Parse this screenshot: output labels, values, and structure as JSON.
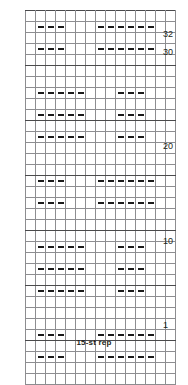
{
  "caption": {
    "repeat_label": "15-st rep"
  },
  "chart_data": {
    "type": "heatmap",
    "title": "",
    "xlabel": "",
    "ylabel": "",
    "columns": 15,
    "rows": 32,
    "row_numbering": "bottom-to-top",
    "legend_position": "none",
    "grid": true,
    "colors": {
      "dark_gray": "#6f6f72",
      "light_gray": "#bdbdc0",
      "white": "#ffffff",
      "grid_line": "#8d8d90",
      "grid_border": "#58585a",
      "symbol": "#1a1a1a",
      "text": "#231f20"
    },
    "symbols": {
      "dash": "purl stitch",
      "blank": "knit stitch"
    },
    "row_tick_labels": [
      {
        "row": 1,
        "label": "1"
      },
      {
        "row": 10,
        "label": "10"
      },
      {
        "row": 20,
        "label": "20"
      },
      {
        "row": 30,
        "label": "30"
      },
      {
        "row": 32,
        "label": "32"
      }
    ],
    "cell_colors": [
      [
        "w",
        "w",
        "w",
        "w",
        "w",
        "w",
        "w",
        "w",
        "w",
        "w",
        "w",
        "w",
        "w",
        "w",
        "w"
      ],
      [
        "w",
        "d",
        "d",
        "d",
        "w",
        "w",
        "w",
        "d",
        "d",
        "d",
        "d",
        "d",
        "d",
        "w",
        "w"
      ],
      [
        "w",
        "d",
        "d",
        "d",
        "w",
        "w",
        "w",
        "d",
        "d",
        "d",
        "d",
        "d",
        "d",
        "w",
        "w"
      ],
      [
        "w",
        "d",
        "d",
        "d",
        "w",
        "w",
        "w",
        "d",
        "d",
        "d",
        "d",
        "d",
        "d",
        "w",
        "w"
      ],
      [
        "w",
        "d",
        "d",
        "d",
        "w",
        "w",
        "w",
        "d",
        "d",
        "d",
        "d",
        "d",
        "d",
        "w",
        "w"
      ],
      [
        "w",
        "w",
        "w",
        "w",
        "w",
        "w",
        "w",
        "w",
        "w",
        "w",
        "w",
        "w",
        "w",
        "w",
        "w"
      ],
      [
        "w",
        "w",
        "w",
        "w",
        "w",
        "w",
        "w",
        "w",
        "w",
        "w",
        "w",
        "w",
        "w",
        "w",
        "w"
      ],
      [
        "w",
        "l",
        "l",
        "l",
        "l",
        "l",
        "w",
        "w",
        "w",
        "l",
        "l",
        "l",
        "w",
        "w",
        "w"
      ],
      [
        "w",
        "l",
        "l",
        "l",
        "l",
        "l",
        "w",
        "w",
        "w",
        "l",
        "l",
        "l",
        "w",
        "w",
        "w"
      ],
      [
        "w",
        "d",
        "d",
        "d",
        "d",
        "d",
        "w",
        "w",
        "w",
        "d",
        "d",
        "d",
        "w",
        "w",
        "w"
      ],
      [
        "w",
        "d",
        "d",
        "d",
        "d",
        "d",
        "w",
        "w",
        "w",
        "d",
        "d",
        "d",
        "w",
        "w",
        "w"
      ],
      [
        "w",
        "l",
        "l",
        "l",
        "l",
        "l",
        "w",
        "w",
        "w",
        "l",
        "l",
        "l",
        "w",
        "w",
        "w"
      ],
      [
        "w",
        "w",
        "w",
        "w",
        "w",
        "w",
        "w",
        "w",
        "w",
        "w",
        "w",
        "w",
        "w",
        "w",
        "w"
      ],
      [
        "w",
        "w",
        "w",
        "w",
        "w",
        "w",
        "w",
        "w",
        "w",
        "w",
        "w",
        "w",
        "w",
        "w",
        "w"
      ],
      [
        "w",
        "w",
        "w",
        "w",
        "w",
        "w",
        "w",
        "w",
        "w",
        "w",
        "w",
        "w",
        "w",
        "w",
        "w"
      ],
      [
        "w",
        "d",
        "d",
        "d",
        "w",
        "w",
        "w",
        "d",
        "d",
        "d",
        "d",
        "d",
        "d",
        "w",
        "w"
      ],
      [
        "w",
        "d",
        "d",
        "d",
        "w",
        "w",
        "w",
        "d",
        "d",
        "d",
        "d",
        "d",
        "d",
        "w",
        "w"
      ],
      [
        "w",
        "d",
        "d",
        "d",
        "w",
        "w",
        "w",
        "d",
        "d",
        "d",
        "d",
        "d",
        "d",
        "w",
        "w"
      ],
      [
        "w",
        "d",
        "d",
        "d",
        "w",
        "w",
        "w",
        "d",
        "d",
        "d",
        "d",
        "d",
        "d",
        "w",
        "w"
      ],
      [
        "w",
        "w",
        "w",
        "w",
        "w",
        "w",
        "w",
        "w",
        "w",
        "w",
        "w",
        "w",
        "w",
        "w",
        "w"
      ],
      [
        "w",
        "w",
        "w",
        "w",
        "w",
        "w",
        "w",
        "w",
        "w",
        "w",
        "w",
        "w",
        "w",
        "w",
        "w"
      ],
      [
        "w",
        "l",
        "l",
        "l",
        "l",
        "l",
        "w",
        "w",
        "w",
        "l",
        "l",
        "l",
        "w",
        "w",
        "w"
      ],
      [
        "w",
        "l",
        "l",
        "l",
        "l",
        "l",
        "w",
        "w",
        "w",
        "l",
        "l",
        "l",
        "w",
        "w",
        "w"
      ],
      [
        "w",
        "d",
        "d",
        "d",
        "d",
        "d",
        "w",
        "w",
        "w",
        "d",
        "d",
        "d",
        "w",
        "w",
        "w"
      ],
      [
        "w",
        "d",
        "d",
        "d",
        "d",
        "d",
        "w",
        "w",
        "w",
        "d",
        "d",
        "d",
        "w",
        "w",
        "w"
      ],
      [
        "w",
        "l",
        "l",
        "l",
        "l",
        "l",
        "w",
        "w",
        "w",
        "l",
        "l",
        "l",
        "w",
        "w",
        "w"
      ],
      [
        "w",
        "w",
        "w",
        "w",
        "w",
        "w",
        "w",
        "w",
        "w",
        "w",
        "w",
        "w",
        "w",
        "w",
        "w"
      ],
      [
        "w",
        "w",
        "w",
        "w",
        "w",
        "w",
        "w",
        "w",
        "w",
        "w",
        "w",
        "w",
        "w",
        "w",
        "w"
      ],
      [
        "w",
        "w",
        "w",
        "w",
        "w",
        "w",
        "w",
        "w",
        "w",
        "w",
        "w",
        "w",
        "w",
        "w",
        "w"
      ],
      [
        "w",
        "d",
        "d",
        "d",
        "w",
        "w",
        "w",
        "d",
        "d",
        "d",
        "d",
        "d",
        "d",
        "w",
        "w"
      ],
      [
        "w",
        "d",
        "d",
        "d",
        "w",
        "w",
        "w",
        "d",
        "d",
        "d",
        "d",
        "d",
        "d",
        "w",
        "w"
      ],
      [
        "w",
        "d",
        "d",
        "d",
        "w",
        "w",
        "w",
        "d",
        "d",
        "d",
        "d",
        "d",
        "d",
        "w",
        "w"
      ],
      [
        "w",
        "d",
        "d",
        "d",
        "w",
        "w",
        "w",
        "d",
        "d",
        "d",
        "d",
        "d",
        "d",
        "w",
        "w"
      ],
      [
        "w",
        "w",
        "w",
        "w",
        "w",
        "w",
        "w",
        "w",
        "w",
        "w",
        "w",
        "w",
        "w",
        "w",
        "w"
      ]
    ],
    "cell_symbols": [
      [
        "",
        "",
        "",
        "",
        "",
        "",
        "",
        "",
        "",
        "",
        "",
        "",
        "",
        "",
        ""
      ],
      [
        "",
        "-",
        "-",
        "-",
        "",
        "",
        "",
        "-",
        "-",
        "-",
        "-",
        "-",
        "-",
        "",
        ""
      ],
      [
        "",
        "",
        "",
        "",
        "",
        "",
        "",
        "",
        "",
        "",
        "",
        "",
        "",
        "",
        ""
      ],
      [
        "",
        "-",
        "-",
        "-",
        "",
        "",
        "",
        "-",
        "-",
        "-",
        "-",
        "-",
        "-",
        "",
        ""
      ],
      [
        "",
        "",
        "",
        "",
        "",
        "",
        "",
        "",
        "",
        "",
        "",
        "",
        "",
        "",
        ""
      ],
      [
        "",
        "",
        "",
        "",
        "",
        "",
        "",
        "",
        "",
        "",
        "",
        "",
        "",
        "",
        ""
      ],
      [
        "",
        "",
        "",
        "",
        "",
        "",
        "",
        "",
        "",
        "",
        "",
        "",
        "",
        "",
        ""
      ],
      [
        "",
        "-",
        "-",
        "-",
        "-",
        "-",
        "",
        "",
        "",
        "-",
        "-",
        "-",
        "",
        "",
        ""
      ],
      [
        "",
        "",
        "",
        "",
        "",
        "",
        "",
        "",
        "",
        "",
        "",
        "",
        "",
        "",
        ""
      ],
      [
        "",
        "-",
        "-",
        "-",
        "-",
        "-",
        "",
        "",
        "",
        "-",
        "-",
        "-",
        "",
        "",
        ""
      ],
      [
        "",
        "",
        "",
        "",
        "",
        "",
        "",
        "",
        "",
        "",
        "",
        "",
        "",
        "",
        ""
      ],
      [
        "",
        "-",
        "-",
        "-",
        "-",
        "-",
        "",
        "",
        "",
        "-",
        "-",
        "-",
        "",
        "",
        ""
      ],
      [
        "",
        "",
        "",
        "",
        "",
        "",
        "",
        "",
        "",
        "",
        "",
        "",
        "",
        "",
        ""
      ],
      [
        "",
        "",
        "",
        "",
        "",
        "",
        "",
        "",
        "",
        "",
        "",
        "",
        "",
        "",
        ""
      ],
      [
        "",
        "",
        "",
        "",
        "",
        "",
        "",
        "",
        "",
        "",
        "",
        "",
        "",
        "",
        ""
      ],
      [
        "",
        "-",
        "-",
        "-",
        "",
        "",
        "",
        "-",
        "-",
        "-",
        "-",
        "-",
        "-",
        "",
        ""
      ],
      [
        "",
        "",
        "",
        "",
        "",
        "",
        "",
        "",
        "",
        "",
        "",
        "",
        "",
        "",
        ""
      ],
      [
        "",
        "-",
        "-",
        "-",
        "",
        "",
        "",
        "-",
        "-",
        "-",
        "-",
        "-",
        "-",
        "",
        ""
      ],
      [
        "",
        "",
        "",
        "",
        "",
        "",
        "",
        "",
        "",
        "",
        "",
        "",
        "",
        "",
        ""
      ],
      [
        "",
        "",
        "",
        "",
        "",
        "",
        "",
        "",
        "",
        "",
        "",
        "",
        "",
        "",
        ""
      ],
      [
        "",
        "",
        "",
        "",
        "",
        "",
        "",
        "",
        "",
        "",
        "",
        "",
        "",
        "",
        ""
      ],
      [
        "",
        "-",
        "-",
        "-",
        "-",
        "-",
        "",
        "",
        "",
        "-",
        "-",
        "-",
        "",
        "",
        ""
      ],
      [
        "",
        "",
        "",
        "",
        "",
        "",
        "",
        "",
        "",
        "",
        "",
        "",
        "",
        "",
        ""
      ],
      [
        "",
        "-",
        "-",
        "-",
        "-",
        "-",
        "",
        "",
        "",
        "-",
        "-",
        "-",
        "",
        "",
        ""
      ],
      [
        "",
        "",
        "",
        "",
        "",
        "",
        "",
        "",
        "",
        "",
        "",
        "",
        "",
        "",
        ""
      ],
      [
        "",
        "-",
        "-",
        "-",
        "-",
        "-",
        "",
        "",
        "",
        "-",
        "-",
        "-",
        "",
        "",
        ""
      ],
      [
        "",
        "",
        "",
        "",
        "",
        "",
        "",
        "",
        "",
        "",
        "",
        "",
        "",
        "",
        ""
      ],
      [
        "",
        "",
        "",
        "",
        "",
        "",
        "",
        "",
        "",
        "",
        "",
        "",
        "",
        "",
        ""
      ],
      [
        "",
        "",
        "",
        "",
        "",
        "",
        "",
        "",
        "",
        "",
        "",
        "",
        "",
        "",
        ""
      ],
      [
        "",
        "-",
        "-",
        "-",
        "",
        "",
        "",
        "-",
        "-",
        "-",
        "-",
        "-",
        "-",
        "",
        ""
      ],
      [
        "",
        "",
        "",
        "",
        "",
        "",
        "",
        "",
        "",
        "",
        "",
        "",
        "",
        "",
        ""
      ],
      [
        "",
        "-",
        "-",
        "-",
        "",
        "",
        "",
        "-",
        "-",
        "-",
        "-",
        "-",
        "-",
        "",
        ""
      ],
      [
        "",
        "",
        "",
        "",
        "",
        "",
        "",
        "",
        "",
        "",
        "",
        "",
        "",
        "",
        ""
      ],
      [
        "",
        "",
        "",
        "",
        "",
        "",
        "",
        "",
        "",
        "",
        "",
        "",
        "",
        "",
        ""
      ]
    ]
  }
}
